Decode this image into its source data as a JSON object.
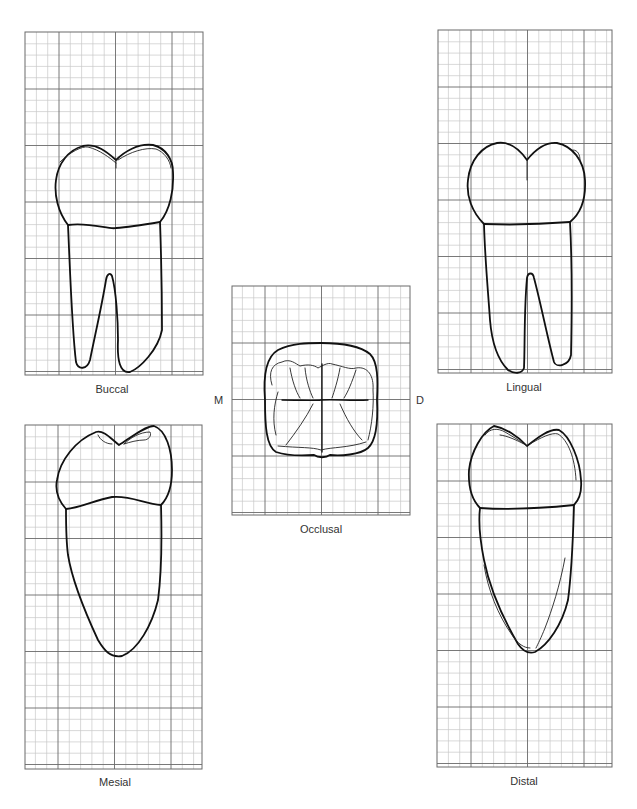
{
  "figure": {
    "views": [
      {
        "id": "buccal",
        "label": "Buccal",
        "grid": {
          "x": 25,
          "y": 32,
          "w": 178,
          "h": 343,
          "x0": 59,
          "y0": 89
        }
      },
      {
        "id": "lingual",
        "label": "Lingual",
        "grid": {
          "x": 438,
          "y": 30,
          "w": 174,
          "h": 343,
          "x0": 471,
          "y0": 87
        }
      },
      {
        "id": "occlusal",
        "label": "Occlusal",
        "grid": {
          "x": 232,
          "y": 286,
          "w": 178,
          "h": 229,
          "x0": 265,
          "y0": 343
        }
      },
      {
        "id": "mesial",
        "label": "Mesial",
        "grid": {
          "x": 25,
          "y": 425,
          "w": 177,
          "h": 344,
          "x0": 58,
          "y0": 482
        }
      },
      {
        "id": "distal",
        "label": "Distal",
        "grid": {
          "x": 437,
          "y": 424,
          "w": 175,
          "h": 343,
          "x0": 471,
          "y0": 481
        }
      }
    ],
    "orientation": {
      "mesial_marker": "M",
      "distal_marker": "D"
    },
    "grid_spacing": {
      "major_px": 56.5,
      "minor_per_major": 5
    }
  }
}
